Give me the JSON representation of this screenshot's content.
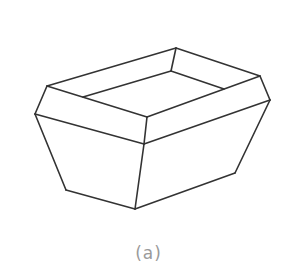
{
  "figure": {
    "caption": "(a)",
    "stroke_color": "#333333",
    "stroke_width": 1.6,
    "caption_color": "#9a9a9a",
    "vertices": {
      "top_back": [
        176,
        48
      ],
      "top_right": [
        260,
        76
      ],
      "right_far": [
        270,
        100
      ],
      "top_left": [
        47,
        86
      ],
      "left_far": [
        35,
        114
      ],
      "front_top": [
        147,
        117
      ],
      "front_mid": [
        144,
        144
      ],
      "inner_back": [
        171,
        71
      ],
      "inner_left": [
        83,
        97
      ],
      "inner_right": [
        224,
        89
      ],
      "bottom_left": [
        66,
        190
      ],
      "bottom_front": [
        135,
        209
      ],
      "bottom_right": [
        235,
        173
      ]
    },
    "edges": [
      [
        "top_left",
        "top_back"
      ],
      [
        "top_back",
        "top_right"
      ],
      [
        "top_right",
        "front_top"
      ],
      [
        "front_top",
        "top_left"
      ],
      [
        "top_back",
        "inner_back"
      ],
      [
        "inner_back",
        "inner_left"
      ],
      [
        "inner_back",
        "inner_right"
      ],
      [
        "top_left",
        "left_far"
      ],
      [
        "top_right",
        "right_far"
      ],
      [
        "left_far",
        "front_mid"
      ],
      [
        "front_mid",
        "right_far"
      ],
      [
        "front_top",
        "front_mid"
      ],
      [
        "left_far",
        "bottom_left"
      ],
      [
        "bottom_left",
        "bottom_front"
      ],
      [
        "bottom_front",
        "bottom_right"
      ],
      [
        "bottom_right",
        "right_far"
      ],
      [
        "front_mid",
        "bottom_front"
      ]
    ]
  }
}
